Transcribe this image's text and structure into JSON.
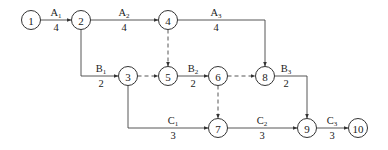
{
  "diagram": {
    "type": "activity-on-arrow network",
    "nodes": [
      {
        "id": "1",
        "label": "1"
      },
      {
        "id": "2",
        "label": "2"
      },
      {
        "id": "3",
        "label": "3"
      },
      {
        "id": "4",
        "label": "4"
      },
      {
        "id": "5",
        "label": "5"
      },
      {
        "id": "6",
        "label": "6"
      },
      {
        "id": "7",
        "label": "7"
      },
      {
        "id": "8",
        "label": "8"
      },
      {
        "id": "9",
        "label": "9"
      },
      {
        "id": "10",
        "label": "10"
      }
    ],
    "activities": [
      {
        "from": "1",
        "to": "2",
        "name": "A",
        "sub": "1",
        "duration": "4"
      },
      {
        "from": "2",
        "to": "4",
        "name": "A",
        "sub": "2",
        "duration": "4"
      },
      {
        "from": "4",
        "to": "8",
        "name": "A",
        "sub": "3",
        "duration": "4"
      },
      {
        "from": "2",
        "to": "3",
        "name": "B",
        "sub": "1",
        "duration": "2"
      },
      {
        "from": "5",
        "to": "6",
        "name": "B",
        "sub": "2",
        "duration": "2"
      },
      {
        "from": "8",
        "to": "9",
        "name": "B",
        "sub": "3",
        "duration": "2"
      },
      {
        "from": "3",
        "to": "7",
        "name": "C",
        "sub": "1",
        "duration": "3"
      },
      {
        "from": "7",
        "to": "9",
        "name": "C",
        "sub": "2",
        "duration": "3"
      },
      {
        "from": "9",
        "to": "10",
        "name": "C",
        "sub": "3",
        "duration": "3"
      }
    ],
    "dummies": [
      {
        "from": "4",
        "to": "5"
      },
      {
        "from": "3",
        "to": "5"
      },
      {
        "from": "6",
        "to": "8"
      },
      {
        "from": "6",
        "to": "7"
      }
    ]
  }
}
